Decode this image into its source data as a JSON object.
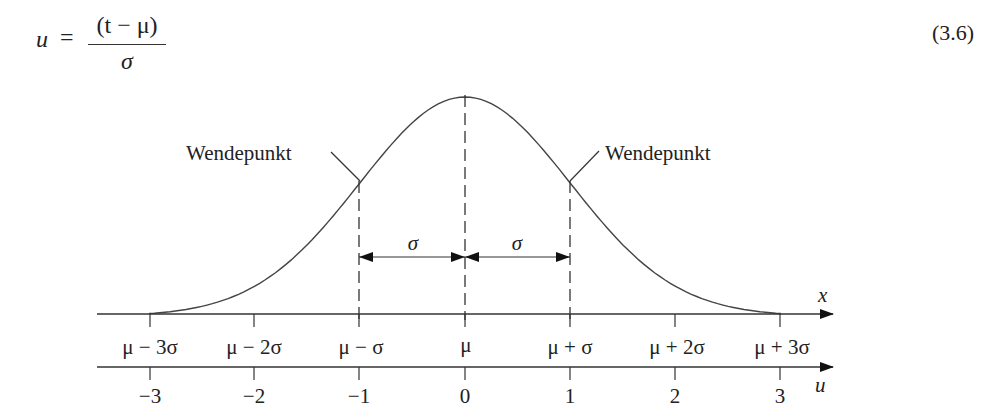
{
  "equation": {
    "lhs": "u",
    "equals": "=",
    "numerator": "(t − μ)",
    "denominator": "σ",
    "number": "(3.6)"
  },
  "figure": {
    "curve": "normal distribution density (bell curve)",
    "inflection_labels": {
      "left": "Wendepunkt",
      "right": "Wendepunkt"
    },
    "sigma_arrows": [
      "σ",
      "σ"
    ],
    "x_axis": {
      "label": "x",
      "ticks": [
        "μ − 3σ",
        "μ − 2σ",
        "μ − σ",
        "μ",
        "μ + σ",
        "μ + 2σ",
        "μ + 3σ"
      ]
    },
    "u_axis": {
      "label": "u",
      "ticks": [
        "−3",
        "−2",
        "−1",
        "0",
        "1",
        "2",
        "3"
      ]
    }
  },
  "chart_data": {
    "type": "line",
    "title": "",
    "xlabel": "x / u",
    "ylabel": "",
    "series": [
      {
        "name": "Normal density",
        "x": [
          -3,
          -2.5,
          -2,
          -1.5,
          -1,
          -0.5,
          0,
          0.5,
          1,
          1.5,
          2,
          2.5,
          3
        ],
        "values": [
          0.011,
          0.044,
          0.135,
          0.325,
          0.607,
          0.882,
          1.0,
          0.882,
          0.607,
          0.325,
          0.135,
          0.044,
          0.011
        ]
      }
    ],
    "x_ticks_top": [
      "μ − 3σ",
      "μ − 2σ",
      "μ − σ",
      "μ",
      "μ + σ",
      "μ + 2σ",
      "μ + 3σ"
    ],
    "x_ticks_bottom": [
      "−3",
      "−2",
      "−1",
      "0",
      "1",
      "2",
      "3"
    ],
    "annotations": [
      "Wendepunkt",
      "Wendepunkt",
      "σ",
      "σ"
    ],
    "xlim": [
      -3.3,
      3.5
    ],
    "grid": false
  }
}
